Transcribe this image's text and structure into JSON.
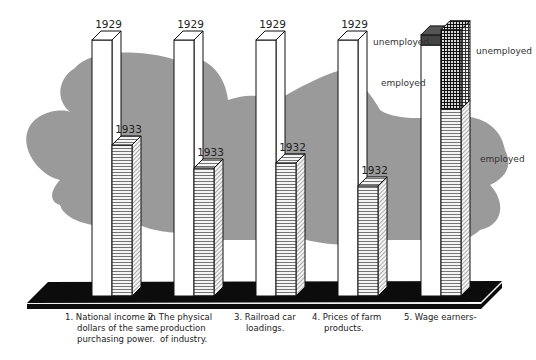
{
  "chart_data": {
    "type": "bar",
    "title": "",
    "xlabel": "",
    "ylabel": "",
    "ylim": [
      0,
      100
    ],
    "units": "percent of 1929 level",
    "grid": false,
    "legend": "none",
    "style": "3d-pictorial",
    "colors": {
      "cloud": "#9a9a9a",
      "base": "#0c0c0c",
      "outline": "#111111",
      "hatch_employed": "#555555",
      "unemployed_dark": "#2a2a2a"
    },
    "categories": [
      {
        "label": "1.  National income in\ndollars of the same\npurchasing power.",
        "lines": [
          "1.  National income in",
          "dollars of the same",
          "purchasing power."
        ],
        "bars": [
          {
            "year": "1929",
            "value": 100,
            "pattern": "white"
          },
          {
            "year": "1933",
            "value": 59,
            "pattern": "hatched"
          }
        ]
      },
      {
        "label": "2.  The physical\nproduction\nof industry.",
        "lines": [
          "2.  The physical",
          "production",
          "of industry."
        ],
        "bars": [
          {
            "year": "1929",
            "value": 100,
            "pattern": "white"
          },
          {
            "year": "1933",
            "value": 50,
            "pattern": "hatched"
          }
        ]
      },
      {
        "label": "3.  Railroad car\nloadings.",
        "lines": [
          "3.  Railroad car",
          "loadings."
        ],
        "bars": [
          {
            "year": "1929",
            "value": 100,
            "pattern": "white"
          },
          {
            "year": "1932",
            "value": 52,
            "pattern": "hatched"
          }
        ]
      },
      {
        "label": "4.  Prices of farm\nproducts.",
        "lines": [
          "4.  Prices of farm",
          "products."
        ],
        "bars": [
          {
            "year": "1929",
            "value": 100,
            "pattern": "white"
          },
          {
            "year": "1932",
            "value": 43,
            "pattern": "hatched"
          }
        ]
      },
      {
        "label": "5.  Wage earners-",
        "lines": [
          "5.  Wage earners-"
        ],
        "bars": [
          {
            "year": "",
            "value": 102,
            "pattern": "stacked",
            "segments": [
              {
                "name": "employed",
                "value": 98,
                "pattern": "white"
              },
              {
                "name": "unemployed",
                "value": 4,
                "pattern": "dark"
              }
            ]
          },
          {
            "year": "",
            "value": 104,
            "pattern": "stacked",
            "segments": [
              {
                "name": "employed",
                "value": 73,
                "pattern": "hatched"
              },
              {
                "name": "unemployed",
                "value": 31,
                "pattern": "crosshatch"
              }
            ]
          }
        ]
      }
    ],
    "annotations": [
      "unemployed",
      "employed",
      "unemployed",
      "employed"
    ]
  }
}
